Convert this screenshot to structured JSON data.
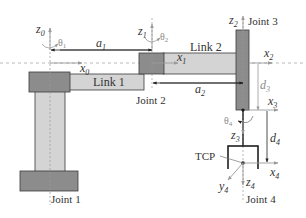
{
  "diagram": {
    "type": "robot-kinematic-schematic",
    "colors": {
      "link_fill": "#d4d4d4",
      "joint_fill": "#8c8c8c",
      "outline": "#3a3a3a",
      "axis": "#9a9a9a",
      "text": "#333333"
    },
    "joints": [
      {
        "id": "joint1",
        "label": "Joint 1"
      },
      {
        "id": "joint2",
        "label": "Joint 2"
      },
      {
        "id": "joint3",
        "label": "Joint 3"
      },
      {
        "id": "joint4",
        "label": "Joint 4"
      }
    ],
    "links": [
      {
        "id": "link1",
        "label": "Link 1"
      },
      {
        "id": "link2",
        "label": "Link 2"
      }
    ],
    "frames": {
      "z0": {
        "base": "z",
        "sub": "0"
      },
      "x0": {
        "base": "x",
        "sub": "0"
      },
      "z1": {
        "base": "z",
        "sub": "1"
      },
      "x1": {
        "base": "x",
        "sub": "1"
      },
      "z2": {
        "base": "z",
        "sub": "2"
      },
      "x2": {
        "base": "x",
        "sub": "2"
      },
      "x3": {
        "base": "x",
        "sub": "3"
      },
      "z3": {
        "base": "z",
        "sub": "3"
      },
      "x4": {
        "base": "x",
        "sub": "4"
      },
      "y4": {
        "base": "y",
        "sub": "4"
      },
      "z4": {
        "base": "z",
        "sub": "4"
      }
    },
    "angles": {
      "theta1": {
        "base": "θ",
        "sub": "1"
      },
      "theta2": {
        "base": "θ",
        "sub": "2"
      },
      "theta4": {
        "base": "θ",
        "sub": "4"
      }
    },
    "dimensions": {
      "a1": {
        "base": "a",
        "sub": "1"
      },
      "a2": {
        "base": "a",
        "sub": "2"
      },
      "d3": {
        "base": "d",
        "sub": "3"
      },
      "d4": {
        "base": "d",
        "sub": "4"
      }
    },
    "tcp_label": "TCP"
  }
}
